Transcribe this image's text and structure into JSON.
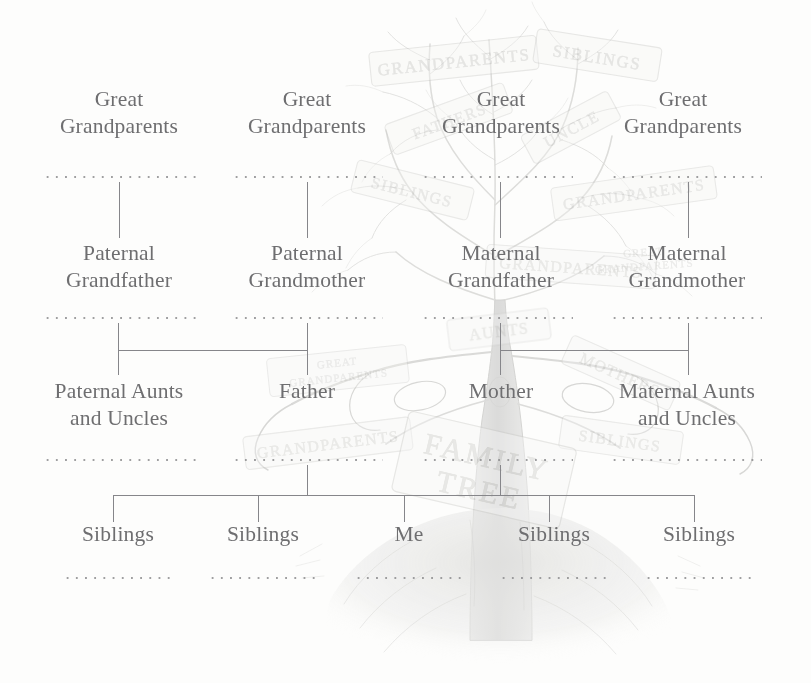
{
  "diagram": {
    "text_color": "#6e6e70",
    "rule_color": "#86868a",
    "background_color": "#fdfdfc",
    "rows": [
      {
        "name": "great-grandparents",
        "nodes": [
          {
            "label": "Great\nGrandparents"
          },
          {
            "label": "Great\nGrandparents"
          },
          {
            "label": "Great\nGrandparents"
          },
          {
            "label": "Great\nGrandparents"
          }
        ]
      },
      {
        "name": "grandparents",
        "nodes": [
          {
            "label": "Paternal\nGrandfather"
          },
          {
            "label": "Paternal\nGrandmother"
          },
          {
            "label": "Maternal\nGrandfather"
          },
          {
            "label": "Maternal\nGrandmother"
          }
        ]
      },
      {
        "name": "parents",
        "nodes": [
          {
            "label": "Paternal Aunts\nand Uncles"
          },
          {
            "label": "Father"
          },
          {
            "label": "Mother"
          },
          {
            "label": "Maternal Aunts\nand Uncles"
          }
        ]
      },
      {
        "name": "children",
        "nodes": [
          {
            "label": "Siblings"
          },
          {
            "label": "Siblings"
          },
          {
            "label": "Me"
          },
          {
            "label": "Siblings"
          },
          {
            "label": "Siblings"
          }
        ]
      }
    ]
  },
  "artwork": {
    "description": "faint pencil sketch of an oak tree with hand-lettered signs",
    "signs": [
      "GRANDPARENTS",
      "SIBLINGS",
      "FATHERS",
      "UNCLE",
      "SIBLINGS",
      "GRANDPARENTS",
      "GREAT GRANDPARENTS",
      "AUNTS",
      "MOTHERS",
      "GRANDPARENTS",
      "FAMILY TREE",
      "SIBLINGS"
    ]
  }
}
